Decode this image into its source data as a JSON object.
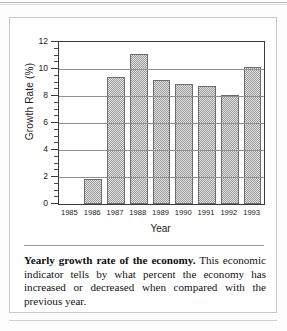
{
  "figure": {
    "caption_lead": "Yearly growth rate of the economy.",
    "caption_body": " This economic indicator tells by what percent the economy has increased or decreased when compared with the previous year."
  },
  "chart_data": {
    "type": "bar",
    "title": "",
    "xlabel": "Year",
    "ylabel": "Growth Rate (%)",
    "categories": [
      "1985",
      "1986",
      "1987",
      "1988",
      "1989",
      "1990",
      "1991",
      "1992",
      "1993"
    ],
    "values": [
      0,
      1.85,
      9.4,
      11.1,
      9.2,
      8.9,
      8.75,
      8.05,
      10.15
    ],
    "ylim": [
      0,
      12
    ],
    "ytick_labels": [
      "0",
      "2",
      "4",
      "6",
      "8",
      "10",
      "12"
    ],
    "ytick_values": [
      0,
      2,
      4,
      6,
      8,
      10,
      12
    ],
    "yminor_step": 0.5,
    "grid": "horizontal",
    "legend": "none",
    "bar_fill": "gray-checker-dither",
    "colors": {
      "bar_fill": "#cfcfcf",
      "bar_edge": "#6c6c6c",
      "axis": "#3a3a3a",
      "gridline": "#8f8f8f",
      "text": "#1a1a1a"
    }
  }
}
